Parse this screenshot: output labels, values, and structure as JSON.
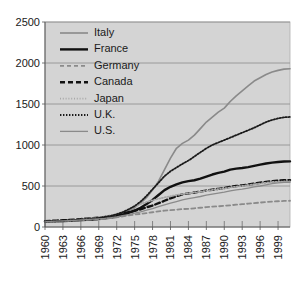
{
  "chart_data": {
    "type": "line",
    "title": "",
    "subtitle": "",
    "xlabel": "",
    "ylabel": "",
    "xlim": [
      1960,
      2001
    ],
    "ylim": [
      0,
      2500
    ],
    "grid": true,
    "legend_position": "top-left",
    "plot_background": "#d4d4d4",
    "gridline_color": "#8c8c8c",
    "x_tick_labels": [
      "1960",
      "1963",
      "1966",
      "1969",
      "1972",
      "1975",
      "1978",
      "1981",
      "1984",
      "1987",
      "1990",
      "1993",
      "1996",
      "1999"
    ],
    "x_tick_values": [
      1960,
      1963,
      1966,
      1969,
      1972,
      1975,
      1978,
      1981,
      1984,
      1987,
      1990,
      1993,
      1996,
      1999
    ],
    "y_tick_labels": [
      "0",
      "500",
      "1000",
      "1500",
      "2000",
      "2500"
    ],
    "y_tick_values": [
      0,
      500,
      1000,
      1500,
      2000,
      2500
    ],
    "x": [
      1960,
      1961,
      1962,
      1963,
      1964,
      1965,
      1966,
      1967,
      1968,
      1969,
      1970,
      1971,
      1972,
      1973,
      1974,
      1975,
      1976,
      1977,
      1978,
      1979,
      1980,
      1981,
      1982,
      1983,
      1984,
      1985,
      1986,
      1987,
      1988,
      1989,
      1990,
      1991,
      1992,
      1993,
      1994,
      1995,
      1996,
      1997,
      1998,
      1999,
      2000,
      2001
    ],
    "series": [
      {
        "name": "Italy",
        "style": "solid",
        "color": "#8a8a8a",
        "width": 1.6,
        "values": [
          70,
          72,
          75,
          80,
          85,
          88,
          92,
          98,
          104,
          110,
          118,
          128,
          140,
          160,
          190,
          235,
          290,
          360,
          450,
          560,
          700,
          840,
          960,
          1020,
          1060,
          1120,
          1200,
          1280,
          1340,
          1400,
          1450,
          1530,
          1600,
          1660,
          1720,
          1780,
          1820,
          1860,
          1890,
          1910,
          1925,
          1930
        ]
      },
      {
        "name": "France",
        "style": "solid",
        "color": "#111111",
        "width": 2.4,
        "values": [
          65,
          66,
          68,
          72,
          76,
          80,
          84,
          88,
          92,
          98,
          105,
          115,
          128,
          148,
          172,
          200,
          235,
          280,
          330,
          390,
          450,
          490,
          520,
          545,
          560,
          570,
          590,
          615,
          640,
          660,
          675,
          700,
          712,
          720,
          730,
          745,
          760,
          775,
          785,
          792,
          798,
          800
        ]
      },
      {
        "name": "Germany",
        "style": "dashed",
        "color": "#8a8a8a",
        "width": 1.8,
        "values": [
          62,
          64,
          66,
          70,
          74,
          78,
          82,
          86,
          90,
          95,
          100,
          108,
          118,
          130,
          142,
          152,
          160,
          170,
          180,
          190,
          200,
          205,
          212,
          218,
          222,
          228,
          235,
          242,
          248,
          252,
          258,
          265,
          272,
          278,
          285,
          292,
          298,
          304,
          310,
          314,
          318,
          320
        ]
      },
      {
        "name": "Canada",
        "style": "dashed",
        "color": "#111111",
        "width": 2.4,
        "values": [
          72,
          74,
          78,
          82,
          86,
          90,
          96,
          102,
          108,
          115,
          122,
          132,
          145,
          162,
          180,
          198,
          215,
          240,
          262,
          290,
          320,
          350,
          375,
          398,
          410,
          420,
          432,
          445,
          455,
          465,
          475,
          490,
          500,
          508,
          518,
          528,
          540,
          550,
          558,
          565,
          570,
          572
        ]
      },
      {
        "name": "Japan",
        "style": "dotted-fine",
        "color": "#a8a8a8",
        "width": 1.8,
        "values": [
          60,
          63,
          67,
          72,
          78,
          84,
          90,
          98,
          106,
          116,
          128,
          142,
          160,
          185,
          215,
          250,
          280,
          305,
          325,
          345,
          360,
          375,
          390,
          400,
          412,
          420,
          430,
          442,
          452,
          462,
          470,
          482,
          492,
          500,
          510,
          520,
          530,
          540,
          548,
          552,
          555,
          556
        ]
      },
      {
        "name": "U.K.",
        "style": "dotted",
        "color": "#1a1a1a",
        "width": 1.8,
        "values": [
          66,
          68,
          71,
          75,
          80,
          85,
          90,
          96,
          103,
          112,
          122,
          136,
          155,
          180,
          215,
          255,
          310,
          380,
          460,
          540,
          620,
          680,
          725,
          770,
          810,
          860,
          910,
          960,
          1000,
          1030,
          1060,
          1090,
          1120,
          1150,
          1180,
          1210,
          1245,
          1280,
          1305,
          1325,
          1338,
          1342
        ]
      },
      {
        "name": "U.S.",
        "style": "solid",
        "color": "#8a8a8a",
        "width": 1.3,
        "values": [
          68,
          69,
          71,
          74,
          78,
          82,
          86,
          90,
          95,
          100,
          106,
          114,
          124,
          138,
          152,
          168,
          185,
          205,
          225,
          248,
          270,
          290,
          310,
          330,
          345,
          358,
          372,
          388,
          400,
          412,
          425,
          440,
          452,
          462,
          475,
          488,
          500,
          515,
          528,
          538,
          544,
          546
        ]
      }
    ]
  },
  "legend": {
    "entries": [
      {
        "label": "Italy"
      },
      {
        "label": "France"
      },
      {
        "label": "Germany"
      },
      {
        "label": "Canada"
      },
      {
        "label": "Japan"
      },
      {
        "label": "U.K."
      },
      {
        "label": "U.S."
      }
    ]
  }
}
